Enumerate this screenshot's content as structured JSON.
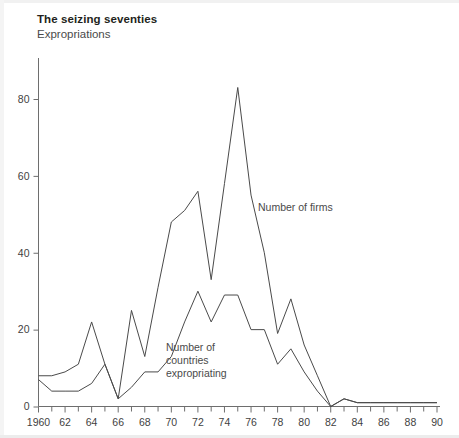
{
  "header": {
    "title": "The seizing seventies",
    "subtitle": "Expropriations"
  },
  "annotations": {
    "firms_label": "Number of firms",
    "countries_label_line1": "Number of",
    "countries_label_line2": "countries",
    "countries_label_line3": "expropriating"
  },
  "colors": {
    "line": "#4a4a4a",
    "axis": "#6e6e6e",
    "text": "#3f3f3f",
    "title": "#231f20"
  },
  "chart_data": {
    "type": "line",
    "title": "The seizing seventies",
    "subtitle": "Expropriations",
    "xlabel": "",
    "ylabel": "",
    "xlim": [
      1960,
      1990
    ],
    "ylim": [
      0,
      88
    ],
    "yticks": [
      0,
      20,
      40,
      60,
      80
    ],
    "ytick_labels": [
      "0",
      "20",
      "40",
      "60",
      "80"
    ],
    "xticks": [
      1960,
      1962,
      1964,
      1966,
      1968,
      1970,
      1972,
      1974,
      1976,
      1978,
      1980,
      1982,
      1984,
      1986,
      1988,
      1990
    ],
    "xtick_labels": [
      "1960",
      "62",
      "64",
      "66",
      "68",
      "70",
      "72",
      "74",
      "76",
      "78",
      "80",
      "82",
      "84",
      "86",
      "88",
      "90"
    ],
    "xtick_minor_every": 1,
    "grid": false,
    "legend": "annotated-inline",
    "x": [
      1960,
      1961,
      1962,
      1963,
      1964,
      1965,
      1966,
      1967,
      1968,
      1969,
      1970,
      1971,
      1972,
      1973,
      1974,
      1975,
      1976,
      1977,
      1978,
      1979,
      1980,
      1981,
      1982,
      1983,
      1984,
      1985,
      1986,
      1987,
      1988,
      1989,
      1990
    ],
    "series": [
      {
        "name": "Number of firms",
        "values": [
          8,
          8,
          9,
          11,
          22,
          11,
          2,
          25,
          13,
          31,
          48,
          51,
          56,
          33,
          58,
          83,
          55,
          40,
          19,
          28,
          16,
          8,
          0,
          2,
          1,
          1,
          1,
          1,
          1,
          1,
          1
        ]
      },
      {
        "name": "Number of countries expropriating",
        "values": [
          7,
          4,
          4,
          4,
          6,
          11,
          2,
          5,
          9,
          9,
          13,
          22,
          30,
          22,
          29,
          29,
          20,
          20,
          11,
          15,
          9,
          4,
          0,
          2,
          1,
          1,
          1,
          1,
          1,
          1,
          1
        ]
      }
    ],
    "annotations": [
      {
        "text": "Number of firms",
        "x": 1977,
        "y": 52
      },
      {
        "text": "Number of countries expropriating",
        "x": 1970,
        "y": 13
      }
    ]
  }
}
